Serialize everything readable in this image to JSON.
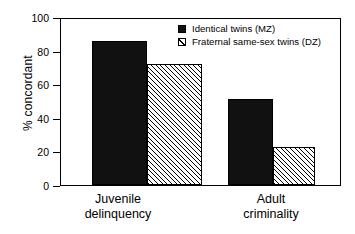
{
  "chart_data": {
    "type": "bar",
    "title": "",
    "xlabel": "",
    "ylabel": "% concordant",
    "ylim": [
      0,
      100
    ],
    "yticks": [
      0,
      20,
      40,
      60,
      80,
      100
    ],
    "grid": false,
    "legend_position": "top-right",
    "categories": [
      "Juvenile delinquency",
      "Adult criminality"
    ],
    "category_lines": [
      [
        "Juvenile",
        "delinquency"
      ],
      [
        "Adult",
        "criminality"
      ]
    ],
    "series": [
      {
        "name": "Identical twins (MZ)",
        "fill": "solid-black",
        "color": "#111111",
        "values": [
          87,
          52
        ]
      },
      {
        "name": "Fraternal same-sex twins (DZ)",
        "fill": "diagonal-hatch",
        "color": "#ffffff",
        "values": [
          73,
          23
        ]
      }
    ]
  },
  "legend": {
    "items": [
      {
        "label": "Identical twins (MZ)",
        "swatch": "solid-swatch"
      },
      {
        "label": "Fraternal same-sex twins (DZ)",
        "swatch": "hatched-swatch"
      }
    ]
  },
  "axis": {
    "y_title": "% concordant",
    "y_tick_labels": [
      "100",
      "80",
      "60",
      "40",
      "20",
      "0"
    ]
  }
}
